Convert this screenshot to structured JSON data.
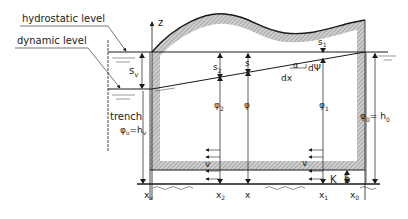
{
  "diagram": {
    "labels": {
      "hydrostatic_level": "hydrostatic level",
      "dynamic_level": "dynamic level",
      "trench": "trench",
      "phi_v": "φ",
      "phi_v_sub": "υ",
      "phi_v_eq": "=h",
      "phi_v_eq_sub": "v",
      "z_axis": "z",
      "s_v": "s",
      "s_v_sub": "v",
      "s_2": "s",
      "s_2_sub": "2",
      "s": "s",
      "s_1": "s",
      "s_1_sub": "1",
      "alpha": "α",
      "d_psi": "dΨ",
      "dx": "dx",
      "phi_2": "φ",
      "phi_2_sub": "2",
      "phi": "φ",
      "phi_1": "φ",
      "phi_1_sub": "1",
      "phi_0": "φ",
      "phi_0_sub": "0",
      "phi_0_eq": "= h",
      "phi_0_eq_sub": "0",
      "v_left": "v",
      "v_right": "v",
      "K": "K",
      "b": "b",
      "x_v": "x",
      "x_v_sub": "v",
      "x_2": "x",
      "x_2_sub": "2",
      "x": "x",
      "x_1": "x",
      "x_1_sub": "1",
      "x_0": "x",
      "x_0_sub": "0"
    },
    "colors": {
      "line": "#1a1a1a",
      "hatch": "#9a9a9a",
      "water": "#555555"
    }
  }
}
